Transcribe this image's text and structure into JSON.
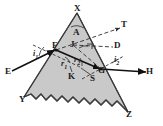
{
  "figure": {
    "kind": "optics-ray-diagram",
    "caption": "Refraction of light through a triangular glass prism",
    "background_color": "#ffffff",
    "prism_fill_color": "#c9c9c9",
    "prism_stroke_color": "#3a3a3a",
    "ray_color": "#111111",
    "dashed_color": "#2b2b2b",
    "label_color": "#1a1a1a"
  },
  "points": {
    "apex": {
      "label": "X",
      "x": 77,
      "y": 9
    },
    "angle_of_prism": {
      "label": "A",
      "x": 76,
      "y": 33
    },
    "deviation_vertex": {
      "label": "J",
      "x": 74,
      "y": 45
    },
    "deviation_mark": {
      "label": "D",
      "x": 116,
      "y": 47
    },
    "incidence_point": {
      "label": "F",
      "x": 56,
      "y": 50
    },
    "emergence_point": {
      "label": "G",
      "x": 101,
      "y": 69
    },
    "normal_foot_left": {
      "label": "K",
      "x": 72,
      "y": 76
    },
    "normal_foot_right": {
      "label": "S",
      "x": 94,
      "y": 78
    },
    "incident_ray_start": {
      "label": "E",
      "x": 9,
      "y": 72
    },
    "emergent_ray_end": {
      "label": "H",
      "x": 148,
      "y": 72
    },
    "produced_ray_end": {
      "label": "T",
      "x": 124,
      "y": 27
    },
    "base_left": {
      "label": "Y",
      "x": 23,
      "y": 100
    },
    "base_right": {
      "label": "Z",
      "x": 128,
      "y": 115
    }
  },
  "angles": [
    {
      "name": "angle-of-incidence",
      "label": "i",
      "sub": "1",
      "x": 36,
      "y": 54
    },
    {
      "name": "angle-of-refraction-first",
      "label": "r",
      "sub": "1",
      "x": 64,
      "y": 64
    },
    {
      "name": "angle-of-refraction-second",
      "label": "r",
      "sub": "2",
      "x": 77,
      "y": 60
    },
    {
      "name": "angle-of-emergence",
      "label": "i",
      "sub": "2",
      "x": 116,
      "y": 60
    }
  ],
  "geometry": {
    "prism_outline": "77,13 128,112 24,97",
    "prism_base_wavy": "M24,97 L31,94 L36,99 L41,94 L46,100 L51,95 L57,101 L62,96 L68,102 L73,97 L79,103 L84,98 L90,104 L95,99 L101,105 L106,100 L112,106 L117,101 L123,107 L128,112",
    "incident_ray": "12,71 L56,50",
    "refracted_ray": "56,50 L101,69",
    "emergent_ray": "101,69 L145,71",
    "normal_at_f": "34,46 L79,67",
    "normal_at_g": "82,78 L122,56",
    "produced_incident": "56,50 L120,29",
    "produced_emergent": "101,69 L74,45",
    "dashed_fg_extension": "56,50 L120,29"
  },
  "legend_text": {
    "description": "EF incident ray, FG refracted ray inside prism, GH emergent ray, FT produced incident ray, D angle of deviation, A angle of prism"
  }
}
